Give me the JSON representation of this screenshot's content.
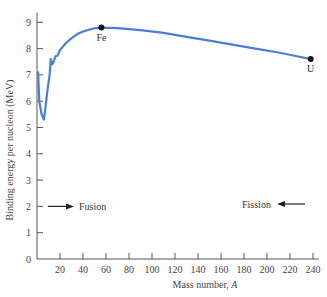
{
  "chart_data": {
    "type": "line",
    "title": "",
    "xlabel": "Mass number, A",
    "xlabel_main": "Mass number, ",
    "xlabel_var": "A",
    "ylabel": "Binding energy per nucleon (MeV)",
    "xlim": [
      0,
      245
    ],
    "ylim": [
      0,
      9.3
    ],
    "grid": false,
    "x_ticks": [
      20,
      40,
      60,
      80,
      100,
      120,
      140,
      160,
      180,
      200,
      220,
      240
    ],
    "y_ticks": [
      0,
      1,
      2,
      3,
      4,
      5,
      6,
      7,
      8,
      9
    ],
    "series": [
      {
        "name": "Binding energy per nucleon",
        "color": "#4a7fd4",
        "x": [
          1,
          2,
          4,
          6,
          7,
          9,
          11,
          12,
          13,
          14,
          16,
          18,
          20,
          25,
          30,
          35,
          40,
          45,
          50,
          56,
          70,
          90,
          110,
          130,
          150,
          170,
          190,
          210,
          225,
          238
        ],
        "y": [
          7.1,
          6.0,
          5.5,
          5.3,
          5.6,
          6.4,
          7.0,
          7.6,
          7.4,
          7.45,
          7.7,
          7.75,
          7.95,
          8.2,
          8.4,
          8.55,
          8.65,
          8.72,
          8.77,
          8.8,
          8.78,
          8.7,
          8.6,
          8.45,
          8.3,
          8.15,
          8.0,
          7.85,
          7.72,
          7.6
        ]
      }
    ],
    "points": [
      {
        "label": "Fe",
        "x": 56,
        "y": 8.8
      },
      {
        "label": "U",
        "x": 238,
        "y": 7.6
      }
    ],
    "annotations": [
      {
        "text": "Fusion",
        "arrow": "right",
        "x": 10,
        "y": 2
      },
      {
        "text": "Fission",
        "arrow": "left",
        "x": 200,
        "y": 2.1
      }
    ]
  }
}
